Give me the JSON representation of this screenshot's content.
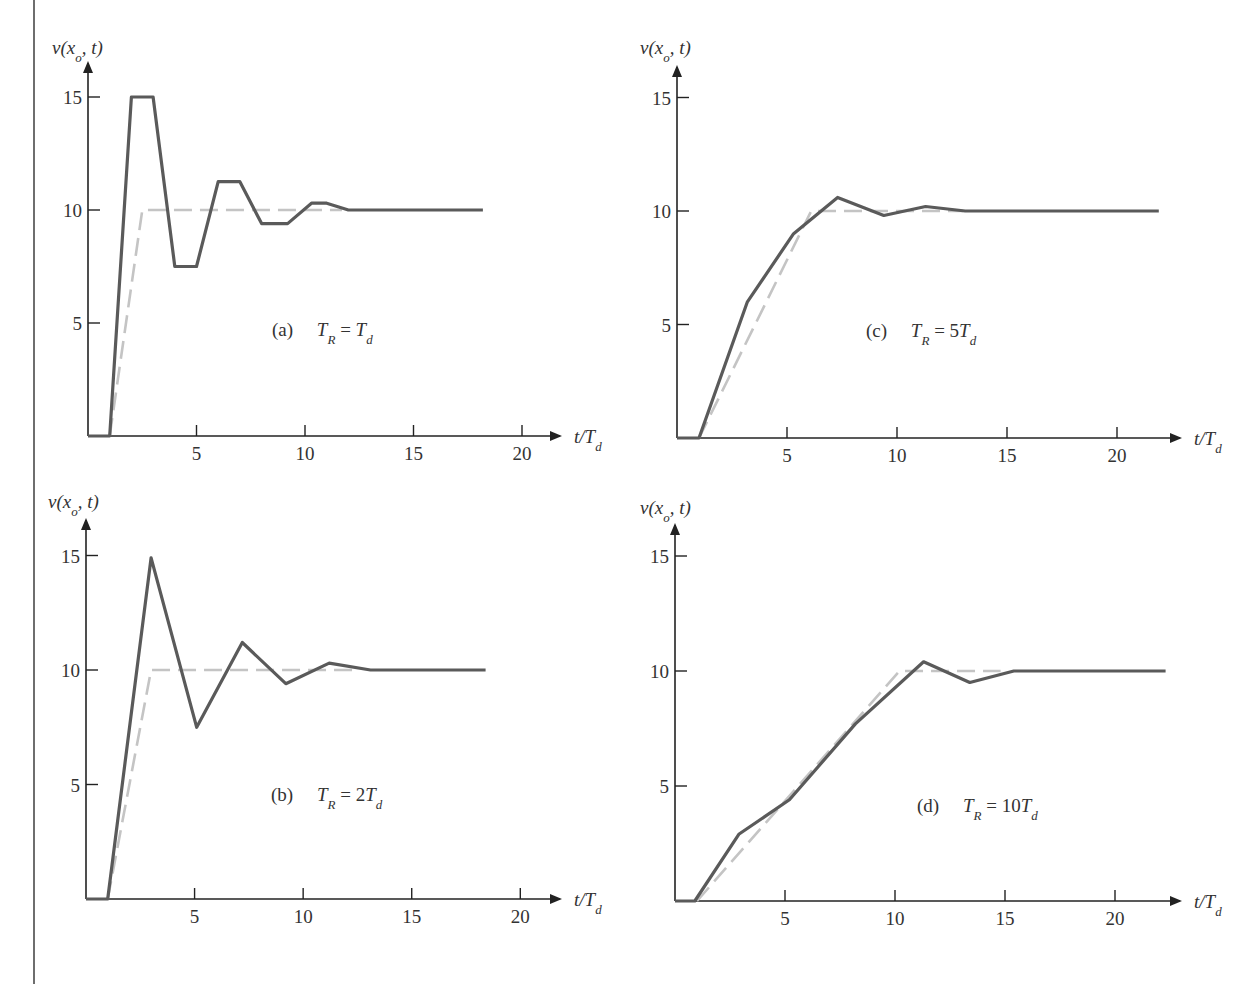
{
  "figure": {
    "y_axis_label": "v(x_o, t)",
    "x_axis_label": "t/T_d",
    "colors": {
      "response": "#5a5a5a",
      "input": "#c4c4c4",
      "axis": "#222222"
    }
  },
  "chart_data": [
    {
      "id": "a",
      "type": "line",
      "panel_label": "(a)",
      "condition": "T_R = T_d",
      "xlabel": "t/T_d",
      "ylabel": "v(x_o, t)",
      "xlim": [
        0,
        21.5
      ],
      "ylim": [
        0,
        15.5
      ],
      "xticks": [
        5,
        10,
        15,
        20
      ],
      "yticks": [
        5,
        10,
        15
      ],
      "grid": false,
      "series": [
        {
          "name": "response",
          "style": "solid",
          "x": [
            0,
            1,
            2,
            3,
            4,
            5,
            6,
            7,
            8,
            9.2,
            10.3,
            11,
            12,
            18.2
          ],
          "y": [
            0,
            0,
            15,
            15,
            7.5,
            7.5,
            11.25,
            11.25,
            9.4,
            9.4,
            10.3,
            10.3,
            10,
            10
          ]
        },
        {
          "name": "input",
          "style": "dashed",
          "x": [
            1,
            2.5,
            11.7
          ],
          "y": [
            0,
            10,
            10
          ]
        }
      ]
    },
    {
      "id": "b",
      "type": "line",
      "panel_label": "(b)",
      "condition": "T_R = 2T_d",
      "xlabel": "t/T_d",
      "ylabel": "v(x_o, t)",
      "xlim": [
        0,
        21.5
      ],
      "ylim": [
        0,
        15.5
      ],
      "xticks": [
        5,
        10,
        15,
        20
      ],
      "yticks": [
        5,
        10,
        15
      ],
      "grid": false,
      "series": [
        {
          "name": "response",
          "style": "solid",
          "x": [
            0,
            1,
            3,
            5.1,
            7.2,
            9.2,
            11.2,
            13.1,
            18.4
          ],
          "y": [
            0,
            0,
            14.9,
            7.5,
            11.2,
            9.4,
            10.3,
            10,
            10
          ]
        },
        {
          "name": "input",
          "style": "dashed",
          "x": [
            1,
            3,
            12.5
          ],
          "y": [
            0,
            10,
            10
          ]
        }
      ]
    },
    {
      "id": "c",
      "type": "line",
      "panel_label": "(c)",
      "condition": "T_R = 5T_d",
      "xlabel": "t/T_d",
      "ylabel": "v(x_o, t)",
      "xlim": [
        0,
        22.7
      ],
      "ylim": [
        0,
        16.5
      ],
      "xticks": [
        5,
        10,
        15,
        20
      ],
      "yticks": [
        5,
        10,
        15
      ],
      "grid": false,
      "series": [
        {
          "name": "response",
          "style": "solid",
          "x": [
            0,
            1,
            3.2,
            5.3,
            7.3,
            9.4,
            11.3,
            13.1,
            21.9
          ],
          "y": [
            0,
            0,
            6,
            9,
            10.6,
            9.8,
            10.2,
            10,
            10
          ]
        },
        {
          "name": "input",
          "style": "dashed",
          "x": [
            1,
            6.1,
            13
          ],
          "y": [
            0,
            10,
            10
          ]
        }
      ]
    },
    {
      "id": "d",
      "type": "line",
      "panel_label": "(d)",
      "condition": "T_R = 10T_d",
      "xlabel": "t/T_d",
      "ylabel": "v(x_o, t)",
      "xlim": [
        0,
        22.8
      ],
      "ylim": [
        0,
        16.5
      ],
      "xticks": [
        5,
        10,
        15,
        20
      ],
      "yticks": [
        5,
        10,
        15
      ],
      "grid": false,
      "series": [
        {
          "name": "response",
          "style": "solid",
          "x": [
            0,
            0.9,
            2.9,
            5.2,
            8.2,
            11.3,
            13.4,
            15.4,
            22.3
          ],
          "y": [
            0,
            0,
            2.9,
            4.4,
            7.7,
            10.4,
            9.5,
            10,
            10
          ]
        },
        {
          "name": "input",
          "style": "dashed",
          "x": [
            1,
            10.2,
            14.8
          ],
          "y": [
            0,
            10,
            10
          ]
        }
      ]
    }
  ]
}
